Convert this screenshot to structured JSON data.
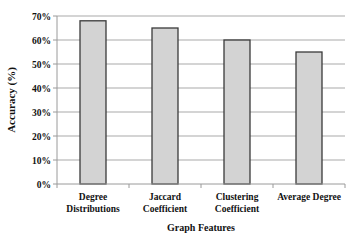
{
  "chart_data": {
    "type": "bar",
    "title": "",
    "xlabel": "Graph Features",
    "ylabel": "Accuracy (%)",
    "categories": [
      [
        "Degree",
        "Distributions"
      ],
      [
        "Jaccard",
        "Coefficient"
      ],
      [
        "Clustering",
        "Coefficient"
      ],
      [
        "Average Degree"
      ]
    ],
    "values": [
      68,
      65,
      60,
      55
    ],
    "ylim": [
      0,
      70
    ],
    "yticks": [
      0,
      10,
      20,
      30,
      40,
      50,
      60,
      70
    ],
    "ytick_labels": [
      "0%",
      "10%",
      "20%",
      "30%",
      "40%",
      "50%",
      "60%",
      "70%"
    ],
    "grid": true,
    "legend": null,
    "colors": {
      "bar_fill": "#d3d3d3",
      "bar_stroke": "#3a3a3a",
      "grid": "#a9a9a9",
      "axis": "#9a9a9a"
    }
  }
}
